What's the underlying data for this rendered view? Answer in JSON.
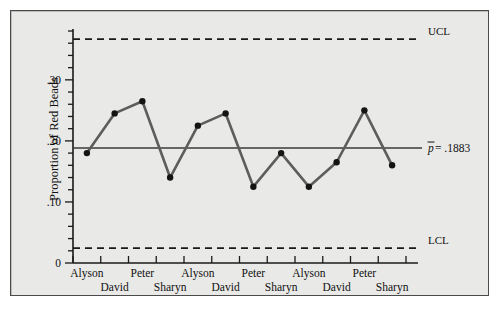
{
  "figure": {
    "panel_bg": "#e9e9e7",
    "border_color": "#4a4a4a",
    "series_color": "#5d5d5d",
    "marker_color": "#141414"
  },
  "axis": {
    "y_title": "Proportion of Red Beads",
    "y_ticks_labeled": [
      {
        "value": 0,
        "label": "0"
      },
      {
        "value": 0.1,
        "label": ".10"
      },
      {
        "value": 0.2,
        "label": ".20"
      },
      {
        "value": 0.3,
        "label": ".30"
      }
    ],
    "y_minor_step": 0.02,
    "y_min": 0,
    "y_max": 0.38
  },
  "annotations": {
    "ucl_label": "UCL",
    "lcl_label": "LCL",
    "center_label_symbol": "p",
    "center_label_text": " = .1883"
  },
  "chart_data": {
    "type": "line",
    "title": "",
    "xlabel": "",
    "ylabel": "Proportion of Red Beads",
    "ylim": [
      0,
      0.38
    ],
    "grid": false,
    "legend": "none",
    "categories": [
      "Alyson",
      "David",
      "Peter",
      "Sharyn",
      "Alyson",
      "David",
      "Peter",
      "Sharyn",
      "Alyson",
      "David",
      "Peter",
      "Sharyn"
    ],
    "series": [
      {
        "name": "Proportion of Red Beads",
        "values": [
          0.18,
          0.245,
          0.265,
          0.14,
          0.225,
          0.245,
          0.125,
          0.18,
          0.125,
          0.165,
          0.25,
          0.16
        ]
      }
    ],
    "control_limits": {
      "center_line": 0.1883,
      "upper_control_limit": 0.3667,
      "lower_control_limit": 0.0244
    }
  }
}
